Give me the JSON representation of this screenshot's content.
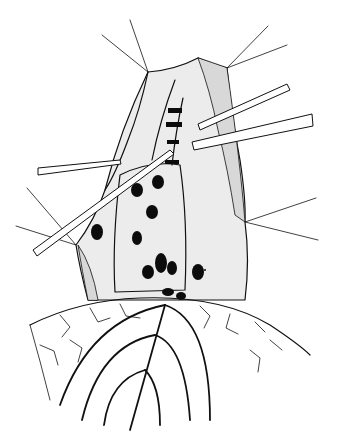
{
  "figure": {
    "colors": {
      "background": "#ffffff",
      "ink": "#111111",
      "shading": "#d8d8d8"
    },
    "sutures": {
      "top_left": 2,
      "top_right": 2,
      "mid_right": 2,
      "mid_left": 2
    },
    "instruments": 3,
    "dark_spots": 12,
    "vessel_arches": 3
  }
}
